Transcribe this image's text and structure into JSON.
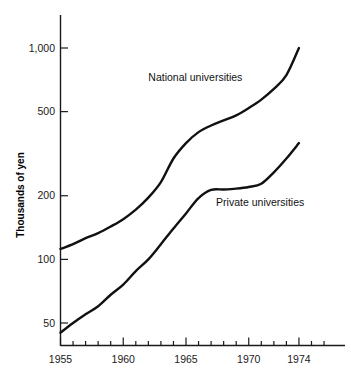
{
  "chart_data": {
    "type": "line",
    "title": "",
    "subtitle": "",
    "xlabel": "",
    "ylabel": "Thousands of yen",
    "yscale": "log",
    "xscale": "linear",
    "grid": false,
    "legend_position": "inline-annotation",
    "xlim": [
      1954,
      1977
    ],
    "ylim": [
      38,
      1250
    ],
    "x_tick_labels": [
      "1955",
      "1960",
      "1965",
      "1970",
      "1974"
    ],
    "x_tick_values": [
      1955,
      1960,
      1965,
      1970,
      1974
    ],
    "x_minor_ticks": [
      1955,
      1956,
      1957,
      1958,
      1959,
      1960,
      1961,
      1962,
      1963,
      1964,
      1965,
      1966,
      1967,
      1968,
      1969,
      1970,
      1971,
      1972,
      1973,
      1974,
      1975,
      1976
    ],
    "y_tick_labels": [
      "1,000",
      "500",
      "200",
      "100",
      "50"
    ],
    "y_tick_values": [
      1000,
      500,
      200,
      100,
      50
    ],
    "x": [
      1955,
      1956,
      1957,
      1958,
      1959,
      1960,
      1961,
      1962,
      1963,
      1964,
      1965,
      1966,
      1967,
      1968,
      1969,
      1970,
      1971,
      1972,
      1973,
      1974
    ],
    "series": [
      {
        "name": "National universities",
        "label": "National universities",
        "color": "#111111",
        "label_x": 1962.0,
        "label_y": 700,
        "values": [
          112,
          118,
          126,
          133,
          143,
          155,
          172,
          196,
          232,
          300,
          355,
          400,
          430,
          455,
          480,
          520,
          570,
          640,
          745,
          1000
        ]
      },
      {
        "name": "Private universities",
        "label": "Private universities",
        "color": "#111111",
        "label_x": 1967.4,
        "label_y": 178,
        "values": [
          45,
          50,
          55,
          60,
          68,
          76,
          88,
          100,
          118,
          140,
          165,
          195,
          213,
          214,
          216,
          220,
          228,
          258,
          300,
          355
        ]
      }
    ]
  },
  "axes": {
    "y_axis_title": "Thousands of yen"
  }
}
